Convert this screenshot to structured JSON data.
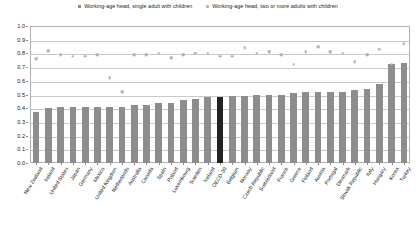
{
  "legend": {
    "position": "top-center",
    "entries": [
      {
        "label": "Working-age head, single adult with children",
        "icon": "square-marker-icon",
        "color": "#8d8d8d"
      },
      {
        "label": "Working-age head, two or more adults with children",
        "icon": "square-marker-icon",
        "color": "#b9b9b9"
      }
    ]
  },
  "chart_data": {
    "type": "bar",
    "title": "",
    "subtitle": "",
    "xlabel": "",
    "ylabel": "",
    "ylim": [
      0.0,
      1.0
    ],
    "grid": true,
    "legend_position": "top-center",
    "ytick_labels": [
      "0.0",
      "0.1",
      "0.2",
      "0.3",
      "0.4",
      "0.5",
      "0.6",
      "0.7",
      "0.8",
      "0.9",
      "1.0"
    ],
    "ytick_values": [
      0.0,
      0.1,
      0.2,
      0.3,
      0.4,
      0.5,
      0.6,
      0.7,
      0.8,
      0.9,
      1.0
    ],
    "highlight_category": "OECD-30",
    "highlight_color": "#222222",
    "categories": [
      "New Zealand",
      "Ireland",
      "United States",
      "Japan",
      "Germany",
      "Mexico",
      "United Kingdom",
      "Netherlands",
      "Australia",
      "Canada",
      "Spain",
      "Poland",
      "Luxembourg",
      "Sweden",
      "Iceland",
      "OECD-30",
      "Belgium",
      "Norway",
      "Czech Republic",
      "Switzerland",
      "France",
      "Greece",
      "Finland",
      "Austria",
      "Portugal",
      "Denmark",
      "Slovak Republic",
      "Italy",
      "Hungary",
      "Korea",
      "Turkey"
    ],
    "series": [
      {
        "name": "Working-age head, single adult with children",
        "render": "bar",
        "color": "#8d8d8d",
        "values": [
          0.37,
          0.4,
          0.41,
          0.41,
          0.41,
          0.41,
          0.41,
          0.41,
          0.42,
          0.42,
          0.44,
          0.44,
          0.46,
          0.47,
          0.48,
          0.48,
          0.49,
          0.49,
          0.5,
          0.5,
          0.5,
          0.51,
          0.52,
          0.52,
          0.52,
          0.52,
          0.53,
          0.54,
          0.58,
          0.72,
          0.73
        ]
      },
      {
        "name": "Working-age head, two or more adults with children",
        "render": "scatter",
        "color": "#b0b0b0",
        "values": [
          0.76,
          0.82,
          0.79,
          0.78,
          0.78,
          0.79,
          0.62,
          0.52,
          0.79,
          0.79,
          0.8,
          0.77,
          0.79,
          0.8,
          0.8,
          0.78,
          0.78,
          0.84,
          0.8,
          0.81,
          0.79,
          0.72,
          0.81,
          0.85,
          0.81,
          0.8,
          0.74,
          0.79,
          0.83,
          0.72,
          0.87
        ]
      }
    ]
  }
}
